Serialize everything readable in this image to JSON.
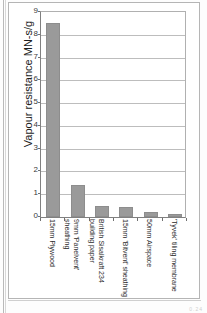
{
  "chart_data": {
    "type": "bar",
    "title": "",
    "xlabel": "",
    "ylabel": "Vapour resistance MN-s/g",
    "ylim": [
      0,
      9
    ],
    "ytick_labels": [
      "9",
      "8",
      "7",
      "6",
      "5",
      "4",
      "3",
      "2",
      "1",
      "0"
    ],
    "grid": true,
    "legend": false,
    "bar_color": "#9a9a9a",
    "categories": [
      "15mm Plywood",
      "9mm 'Panelvent' sheathing",
      "British Sisalkraft 234 building paper",
      "15mm 'Bitvent' sheathing",
      "50mm Airspace",
      "'Tyvek' tiling membrane"
    ],
    "values": [
      8.5,
      1.4,
      0.47,
      0.42,
      0.2,
      0.12
    ]
  },
  "footer": {
    "corner_mark": "0.24"
  }
}
